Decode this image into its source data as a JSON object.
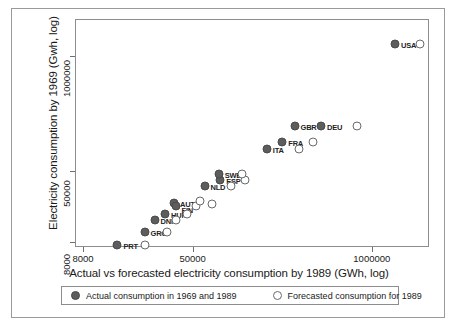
{
  "chart_data": {
    "type": "scatter",
    "title": "",
    "xlabel": "Actual vs forecasted electricity consumption by 1989 (GWh, log)",
    "ylabel": "Electricity consumption by 1969 (Gwh, log)",
    "xscale": "log",
    "yscale": "log",
    "xlim": [
      7000,
      2600000
    ],
    "ylim": [
      7000,
      2600000
    ],
    "xticks": [
      {
        "value": 8000,
        "label": "8000"
      },
      {
        "value": 50000,
        "label": "50000"
      },
      {
        "value": 1000000,
        "label": "1000000"
      }
    ],
    "yticks": [
      {
        "value": 8000,
        "label": "8000"
      },
      {
        "value": 50000,
        "label": "50000"
      },
      {
        "value": 1000000,
        "label": "1000000"
      }
    ],
    "grid": false,
    "legend_position": "bottom",
    "series": [
      {
        "name": "Actual consumption in 1969 and 1989",
        "marker": "filled-circle",
        "color": "#5d5d5d",
        "points": [
          {
            "label": "PRT",
            "x": 14000,
            "y": 7600
          },
          {
            "label": "GRC",
            "x": 22000,
            "y": 10500
          },
          {
            "label": "DNK",
            "x": 26000,
            "y": 14500
          },
          {
            "label": "HUN",
            "x": 31000,
            "y": 17000
          },
          {
            "label": "AUT",
            "x": 36000,
            "y": 22500
          },
          {
            "label": "FIN",
            "x": 37000,
            "y": 21000
          },
          {
            "label": "NLD",
            "x": 60000,
            "y": 35000
          },
          {
            "label": "ESP",
            "x": 78000,
            "y": 41000
          },
          {
            "label": "SWE",
            "x": 76000,
            "y": 48000
          },
          {
            "label": "ITA",
            "x": 170000,
            "y": 92000
          },
          {
            "label": "FRA",
            "x": 220000,
            "y": 110000
          },
          {
            "label": "GBR",
            "x": 270000,
            "y": 165000
          },
          {
            "label": "DEU",
            "x": 420000,
            "y": 165000
          },
          {
            "label": "USA",
            "x": 1450000,
            "y": 1400000
          }
        ]
      },
      {
        "name": "Forecasted consumption for 1989",
        "marker": "open-circle",
        "color": "#ffffff",
        "points": [
          {
            "label": "PRT",
            "x": 22000,
            "y": 7600
          },
          {
            "label": "GRC",
            "x": 32000,
            "y": 10500
          },
          {
            "label": "DNK",
            "x": 37000,
            "y": 14500
          },
          {
            "label": "HUN",
            "x": 45000,
            "y": 17000
          },
          {
            "label": "FIN",
            "x": 52000,
            "y": 21000
          },
          {
            "label": "AUT",
            "x": 56000,
            "y": 23500
          },
          {
            "label": "AUT2",
            "x": 68000,
            "y": 22000
          },
          {
            "label": "NLD",
            "x": 93000,
            "y": 35000
          },
          {
            "label": "ESP",
            "x": 118000,
            "y": 41000
          },
          {
            "label": "SWE",
            "x": 112000,
            "y": 48000
          },
          {
            "label": "ITA",
            "x": 290000,
            "y": 92000
          },
          {
            "label": "FRA",
            "x": 370000,
            "y": 110000
          },
          {
            "label": "GBR",
            "x": 770000,
            "y": 165000
          },
          {
            "label": "USA",
            "x": 2200000,
            "y": 1400000
          }
        ]
      }
    ]
  },
  "legend": {
    "entries": [
      {
        "label": "Actual consumption in 1969 and 1989",
        "marker": "filled-circle"
      },
      {
        "label": "Forecasted consumption for 1989",
        "marker": "open-circle"
      }
    ]
  }
}
